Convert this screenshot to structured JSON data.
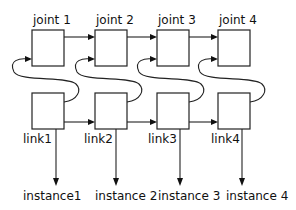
{
  "diagram": {
    "joints": [
      {
        "label": "joint 1"
      },
      {
        "label": "joint 2"
      },
      {
        "label": "joint 3"
      },
      {
        "label": "joint 4"
      }
    ],
    "links": [
      {
        "label": "link1"
      },
      {
        "label": "link2"
      },
      {
        "label": "link3"
      },
      {
        "label": "link4"
      }
    ],
    "instances": [
      {
        "label": "instance1"
      },
      {
        "label": "instance 2"
      },
      {
        "label": "instance 3"
      },
      {
        "label": "instance 4"
      }
    ],
    "colors": {
      "stroke": "#222222",
      "background": "#ffffff"
    }
  }
}
